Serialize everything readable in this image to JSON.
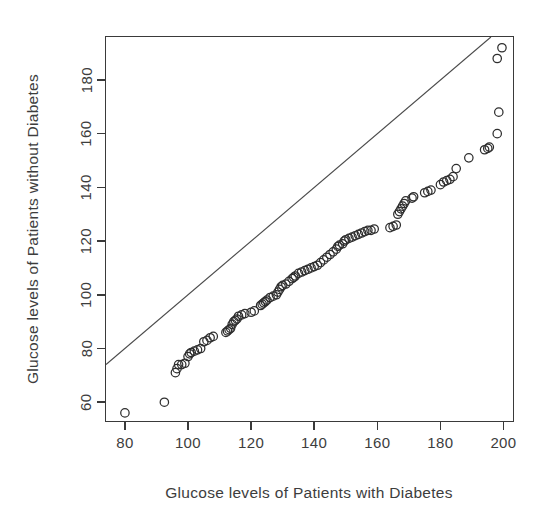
{
  "chart_data": {
    "type": "scatter",
    "title": "",
    "subtitle": "",
    "xlabel": "Glucose levels of Patients with Diabetes",
    "ylabel": "Glucose levels of Patients without Diabetes",
    "xlim": [
      74,
      203
    ],
    "ylim": [
      53,
      196
    ],
    "xticks": [
      80,
      100,
      120,
      140,
      160,
      180,
      200
    ],
    "yticks": [
      60,
      80,
      100,
      120,
      140,
      160,
      180
    ],
    "xtick_labels": [
      "80",
      "100",
      "120",
      "140",
      "160",
      "180",
      "200"
    ],
    "ytick_labels": [
      "60",
      "80",
      "100",
      "120",
      "140",
      "160",
      "180"
    ],
    "grid": false,
    "legend": "none",
    "annotations": [],
    "marker": {
      "shape": "open-circle",
      "radius_px": 4.2,
      "stroke": "#2e2e2e",
      "fill": "none"
    },
    "reference_line": {
      "name": "identity-line",
      "type": "line",
      "slope": 1,
      "intercept": 0,
      "stroke": "#4a4a4a",
      "x_from": 74,
      "y_from": 74,
      "x_to": 196,
      "y_to": 196
    },
    "series": [
      {
        "name": "qq-points",
        "marker": "open-circle",
        "points": [
          [
            80,
            56
          ],
          [
            92.5,
            60
          ],
          [
            96,
            71
          ],
          [
            96.5,
            72.5
          ],
          [
            97,
            74
          ],
          [
            98,
            74
          ],
          [
            99,
            74.5
          ],
          [
            100,
            77
          ],
          [
            100.5,
            78
          ],
          [
            101,
            78.5
          ],
          [
            102,
            79
          ],
          [
            103,
            79.5
          ],
          [
            104,
            80
          ],
          [
            105,
            82.5
          ],
          [
            106,
            83
          ],
          [
            107,
            84
          ],
          [
            108,
            84.5
          ],
          [
            112,
            86
          ],
          [
            112.5,
            86.5
          ],
          [
            113,
            87
          ],
          [
            113.5,
            87.5
          ],
          [
            114,
            89
          ],
          [
            114.5,
            90
          ],
          [
            115,
            90.5
          ],
          [
            115.5,
            91
          ],
          [
            116,
            92
          ],
          [
            117,
            92.5
          ],
          [
            118,
            93
          ],
          [
            120,
            93.5
          ],
          [
            121,
            94
          ],
          [
            123,
            96
          ],
          [
            123.5,
            96.5
          ],
          [
            124,
            97
          ],
          [
            124.5,
            97.5
          ],
          [
            125,
            98
          ],
          [
            126,
            99
          ],
          [
            127,
            99.5
          ],
          [
            128,
            100
          ],
          [
            128.5,
            101
          ],
          [
            129,
            102
          ],
          [
            129.5,
            103
          ],
          [
            130,
            103.5
          ],
          [
            131,
            104
          ],
          [
            132,
            105
          ],
          [
            133,
            106
          ],
          [
            133.5,
            106.5
          ],
          [
            134,
            107
          ],
          [
            135,
            108
          ],
          [
            136,
            108.5
          ],
          [
            137,
            109
          ],
          [
            138,
            109.5
          ],
          [
            139,
            110
          ],
          [
            140,
            110.5
          ],
          [
            141,
            111
          ],
          [
            142,
            112
          ],
          [
            143,
            113
          ],
          [
            144,
            114
          ],
          [
            145,
            115
          ],
          [
            146,
            116
          ],
          [
            147,
            117
          ],
          [
            147.5,
            118
          ],
          [
            148,
            118.5
          ],
          [
            149,
            119
          ],
          [
            149.5,
            120
          ],
          [
            150,
            120.5
          ],
          [
            151,
            121
          ],
          [
            152,
            121.5
          ],
          [
            153,
            122
          ],
          [
            154,
            122.5
          ],
          [
            155,
            123
          ],
          [
            156,
            123.5
          ],
          [
            157,
            124
          ],
          [
            158,
            124
          ],
          [
            159,
            124.5
          ],
          [
            164,
            125
          ],
          [
            165,
            125.5
          ],
          [
            166,
            126
          ],
          [
            166.5,
            130
          ],
          [
            167,
            131
          ],
          [
            167.5,
            132
          ],
          [
            168,
            133
          ],
          [
            168.5,
            134
          ],
          [
            169,
            135
          ],
          [
            171,
            136
          ],
          [
            171.5,
            136.5
          ],
          [
            175,
            138
          ],
          [
            176,
            138.5
          ],
          [
            177,
            139
          ],
          [
            180,
            141
          ],
          [
            181,
            142
          ],
          [
            182,
            142.5
          ],
          [
            183,
            143
          ],
          [
            184,
            144
          ],
          [
            185,
            147
          ],
          [
            189,
            151
          ],
          [
            194,
            154
          ],
          [
            195,
            154.5
          ],
          [
            195.5,
            155
          ],
          [
            198,
            160
          ],
          [
            198.5,
            168
          ],
          [
            198,
            188
          ],
          [
            199.5,
            192
          ]
        ]
      }
    ]
  },
  "axes": {
    "x_title": "Glucose levels of Patients with Diabetes",
    "y_title": "Glucose levels of Patients without Diabetes"
  }
}
